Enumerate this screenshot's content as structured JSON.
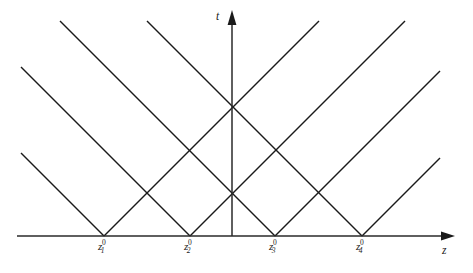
{
  "figure": {
    "kind": "spacetime-characteristics-diagram",
    "background_color": "#ffffff",
    "line_color": "#1a1a1a",
    "axis_color": "#2a2a2a"
  },
  "axes": {
    "vertical": {
      "label": "t",
      "name": "t-axis",
      "x": 232,
      "y_bottom": 236,
      "y_top": 12,
      "arrow": "up-arrow-icon"
    },
    "horizontal": {
      "label": "z",
      "name": "z-axis",
      "y": 236,
      "x_left": 17,
      "x_right": 455,
      "arrow": "right-arrow-icon"
    }
  },
  "ticks": [
    {
      "base": "z",
      "sub": "1",
      "sup": "0",
      "x": 104
    },
    {
      "base": "z",
      "sub": "2",
      "sup": "0",
      "x": 190
    },
    {
      "base": "z",
      "sub": "3",
      "sup": "0",
      "x": 275
    },
    {
      "base": "z",
      "sub": "4",
      "sup": "0",
      "x": 362
    }
  ],
  "chart_data": {
    "type": "line",
    "title": "",
    "xlabel": "z",
    "ylabel": "t",
    "grid": false,
    "legend": "none",
    "vertex_positions_px": [
      104,
      190,
      275,
      362
    ],
    "vertex_spacing_px": 86,
    "baseline_y_px": 236,
    "clip_top_y_px": 21,
    "clip_left_x_px": 21,
    "clip_right_x_px": 440,
    "series": [
      {
        "name": "cone-1-left",
        "x": [
          104,
          21
        ],
        "y": [
          236,
          153
        ]
      },
      {
        "name": "cone-1-right",
        "x": [
          104,
          319
        ],
        "y": [
          236,
          21
        ]
      },
      {
        "name": "cone-2-left",
        "x": [
          190,
          21
        ],
        "y": [
          236,
          67
        ]
      },
      {
        "name": "cone-2-right",
        "x": [
          190,
          405
        ],
        "y": [
          236,
          21
        ]
      },
      {
        "name": "cone-3-left",
        "x": [
          275,
          60
        ],
        "y": [
          236,
          21
        ]
      },
      {
        "name": "cone-3-right",
        "x": [
          275,
          440
        ],
        "y": [
          236,
          71
        ]
      },
      {
        "name": "cone-4-left",
        "x": [
          362,
          147
        ],
        "y": [
          236,
          21
        ]
      },
      {
        "name": "cone-4-right",
        "x": [
          362,
          440
        ],
        "y": [
          236,
          158
        ]
      }
    ],
    "intersections_px": [
      {
        "name": "axis-crossing-lower",
        "x": 232,
        "y": 192
      },
      {
        "name": "axis-crossing-upper",
        "x": 232,
        "y": 110
      },
      {
        "name": "crossing-left",
        "x": 190,
        "y": 150
      },
      {
        "name": "crossing-right",
        "x": 275,
        "y": 150
      },
      {
        "name": "crossing-far-left",
        "x": 147,
        "y": 193
      },
      {
        "name": "crossing-far-right",
        "x": 319,
        "y": 193
      }
    ]
  }
}
